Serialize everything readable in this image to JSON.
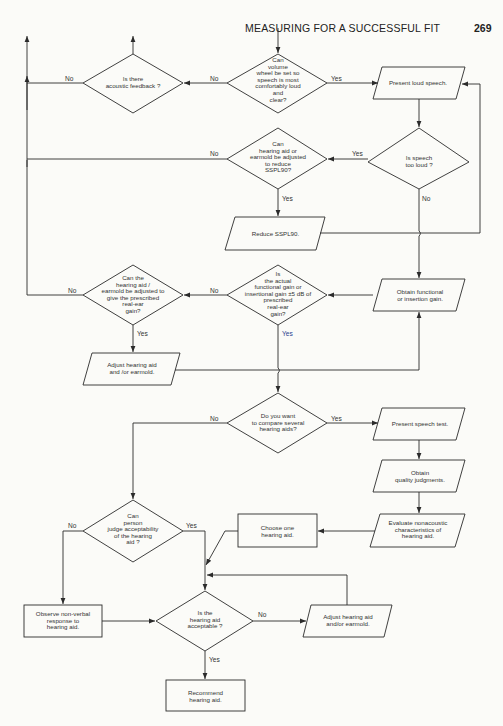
{
  "header": {
    "title": "MEASURING FOR A SUCCESSFUL FIT",
    "page_number": "269"
  },
  "nodes": {
    "acoustic_feedback": "Is there\nacoustic feedback ?",
    "volume_wheel": "Can\nvolume\nwheel be set so\nspeech is most\ncomfortably loud\nand\nclear?",
    "present_loud_speech": "Present loud speech.",
    "speech_too_loud": "Is speech\ntoo loud ?",
    "adjust_sspl90": "Can\nhearing aid or\nearmold be adjusted\nto reduce\nSSPL90?",
    "reduce_sspl90": "Reduce SSPL90.",
    "obtain_gain": "Obtain functional\nor insertion gain.",
    "gain_within": "Is\nthe actual\nfunctional gain or\ninsertional gain ±5 dB of\nprescribed\nreal-ear\ngain?",
    "can_adjust_gain": "Can the\nhearing aid /\nearmold be adjusted to\ngive the prescribed\nreal-ear\ngain?",
    "adjust_aid_1": "Adjust hearing aid\nand /or earmold.",
    "compare_aids": "Do you want\nto compare several\nhearing aids?",
    "present_speech_test": "Present speech test.",
    "quality_judgments": "Obtain\nquality judgments.",
    "evaluate_nonacoustic": "Evaluate nonacoustic\ncharacteristics of\nhearing aid.",
    "choose_one": "Choose one\nhearing aid.",
    "judge_acceptability": "Can\nperson\njudge acceptability\nof the hearing\naid ?",
    "observe_nonverbal": "Observe non-verbal\nresponse to\nhearing aid.",
    "aid_acceptable": "Is the\nhearing aid\nacceptable  ?",
    "adjust_aid_2": "Adjust hearing aid\nand/or earmold.",
    "recommend": "Recommend\nhearing aid."
  },
  "edges": {
    "yes": "Yes",
    "no": "No"
  },
  "colors": {
    "line": "#2b2b2b",
    "paper": "#fbfbf8",
    "yes_blue": "#2a3f8f"
  }
}
